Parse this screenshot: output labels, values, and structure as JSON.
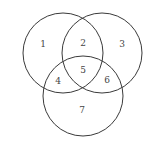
{
  "diagram": {
    "type": "venn-3",
    "stroke_color": "#3a3a3a",
    "label_color": "#444444",
    "circles": [
      {
        "name": "top-left",
        "cx": 63,
        "cy": 53,
        "r": 40
      },
      {
        "name": "top-right",
        "cx": 102,
        "cy": 53,
        "r": 40
      },
      {
        "name": "bottom",
        "cx": 83,
        "cy": 96,
        "r": 40
      }
    ],
    "regions": [
      {
        "label": "1",
        "x": 43,
        "y": 44
      },
      {
        "label": "2",
        "x": 83,
        "y": 43
      },
      {
        "label": "3",
        "x": 122,
        "y": 44
      },
      {
        "label": "4",
        "x": 58,
        "y": 81
      },
      {
        "label": "5",
        "x": 83,
        "y": 70
      },
      {
        "label": "6",
        "x": 107,
        "y": 80
      },
      {
        "label": "7",
        "x": 82,
        "y": 110
      }
    ]
  }
}
